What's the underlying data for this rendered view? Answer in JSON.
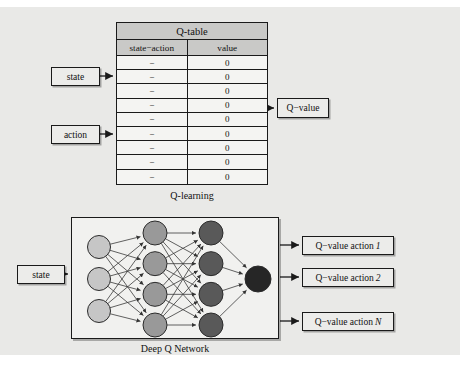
{
  "diagram": {
    "background_color": "#e9e9e7",
    "line_color": "#1a1a1a"
  },
  "qlearning": {
    "caption": "Q-learning",
    "table": {
      "title": "Q-table",
      "columns": [
        "state−action",
        "value"
      ],
      "rows": [
        [
          "−",
          "0"
        ],
        [
          "−",
          "0"
        ],
        [
          "−",
          "0"
        ],
        [
          "−",
          "0"
        ],
        [
          "−",
          "0"
        ],
        [
          "−",
          "0"
        ],
        [
          "−",
          "0"
        ],
        [
          "−",
          "0"
        ],
        [
          "−",
          "0"
        ]
      ]
    },
    "inputs": {
      "state": "state",
      "action": "action"
    },
    "output": "Q−value"
  },
  "dqn": {
    "caption": "Deep Q Network",
    "input": "state",
    "outputs": [
      {
        "prefix": "Q−value action ",
        "suffix": "1"
      },
      {
        "prefix": "Q−value action ",
        "suffix": "2"
      },
      {
        "prefix": "Q−value action ",
        "suffix": "N"
      }
    ],
    "network": {
      "layers": [
        {
          "name": "input-layer",
          "count": 3,
          "color": "#c6c6c6"
        },
        {
          "name": "hidden-layer-1",
          "count": 4,
          "color": "#999999"
        },
        {
          "name": "hidden-layer-2",
          "count": 4,
          "color": "#595959"
        },
        {
          "name": "output-layer",
          "count": 1,
          "color": "#262626"
        }
      ]
    }
  }
}
